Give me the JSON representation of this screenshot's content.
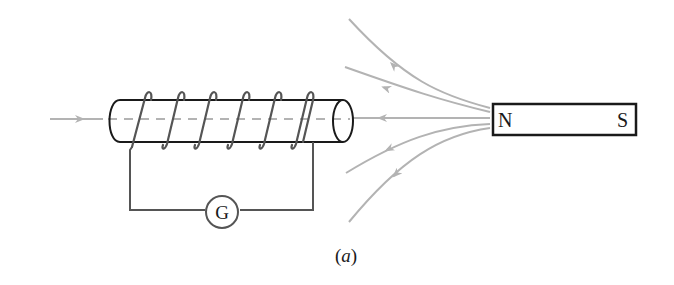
{
  "figure": {
    "caption": "(a)",
    "caption_letter": "a",
    "magnet": {
      "north_label": "N",
      "south_label": "S"
    },
    "galvanometer": {
      "label": "G"
    },
    "colors": {
      "ink": "#1a1a1a",
      "wire": "#555555",
      "field_line": "#b3b3b3",
      "background": "#ffffff"
    }
  }
}
